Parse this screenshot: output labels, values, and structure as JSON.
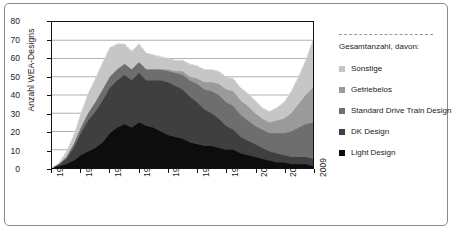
{
  "chart_data": {
    "type": "area",
    "title": "",
    "xlabel": "",
    "ylabel": "Anzahl WEA-Designs",
    "ylim": [
      0,
      80
    ],
    "ytick_values": [
      0,
      10,
      20,
      30,
      40,
      50,
      60,
      70,
      80
    ],
    "xlim": [
      1973,
      2009
    ],
    "xtick_labels": [
      "1973",
      "1977",
      "1981",
      "1985",
      "1989",
      "1993",
      "1997",
      "2001",
      "2005",
      "2009"
    ],
    "grid": "horizontal",
    "stacked": true,
    "legend_position": "right",
    "legend_title": "Gesamtanzahl, davon:",
    "x": [
      1973,
      1974,
      1975,
      1976,
      1977,
      1978,
      1979,
      1980,
      1981,
      1982,
      1983,
      1984,
      1985,
      1986,
      1987,
      1988,
      1989,
      1990,
      1991,
      1992,
      1993,
      1994,
      1995,
      1996,
      1997,
      1998,
      1999,
      2000,
      2001,
      2002,
      2003,
      2004,
      2005,
      2006,
      2007,
      2008,
      2009
    ],
    "series": [
      {
        "name": "Light Design",
        "color": "#0d0d0d",
        "values": [
          0,
          1,
          2,
          4,
          7,
          9,
          11,
          14,
          19,
          22,
          24,
          22,
          25,
          23,
          22,
          20,
          18,
          17,
          16,
          14,
          13,
          12,
          12,
          11,
          10,
          10,
          8,
          7,
          6,
          5,
          4,
          3,
          3,
          2,
          2,
          2,
          1
        ]
      },
      {
        "name": "DK Design",
        "color": "#3f3f3f",
        "values": [
          0,
          1,
          3,
          7,
          12,
          17,
          20,
          23,
          25,
          26,
          27,
          26,
          27,
          25,
          26,
          28,
          29,
          28,
          27,
          25,
          23,
          20,
          18,
          16,
          13,
          11,
          9,
          8,
          7,
          6,
          5,
          5,
          4,
          4,
          4,
          4,
          4
        ]
      },
      {
        "name": "Standard Drive Train Design",
        "color": "#6e6e6e",
        "values": [
          0,
          0,
          1,
          2,
          3,
          4,
          5,
          6,
          6,
          6,
          6,
          6,
          6,
          6,
          6,
          6,
          6,
          7,
          8,
          9,
          10,
          11,
          12,
          13,
          13,
          13,
          12,
          11,
          10,
          10,
          10,
          11,
          12,
          14,
          16,
          18,
          20
        ]
      },
      {
        "name": "Getriebelos",
        "color": "#9a9a9a",
        "values": [
          0,
          0,
          0,
          0,
          0,
          0,
          0,
          0,
          0,
          0,
          0,
          0,
          0,
          0,
          0,
          0,
          1,
          1,
          2,
          2,
          3,
          4,
          5,
          6,
          7,
          8,
          8,
          8,
          7,
          6,
          6,
          7,
          8,
          10,
          13,
          16,
          19
        ]
      },
      {
        "name": "Sonstige",
        "color": "#c6c6c6",
        "values": [
          0,
          1,
          3,
          5,
          8,
          11,
          13,
          15,
          16,
          14,
          11,
          10,
          10,
          9,
          8,
          7,
          6,
          6,
          6,
          7,
          7,
          7,
          7,
          7,
          7,
          7,
          7,
          7,
          7,
          6,
          6,
          7,
          9,
          12,
          15,
          19,
          26
        ]
      }
    ],
    "total_values": [
      0,
      3,
      9,
      18,
      30,
      41,
      49,
      58,
      66,
      68,
      68,
      64,
      68,
      63,
      62,
      61,
      60,
      59,
      59,
      57,
      56,
      54,
      54,
      53,
      50,
      49,
      44,
      41,
      37,
      33,
      31,
      33,
      36,
      42,
      50,
      59,
      70
    ]
  },
  "legend": {
    "title": "Gesamtanzahl, davon:",
    "items": [
      {
        "label": "Sonstige",
        "color": "#c6c6c6"
      },
      {
        "label": "Getriebelos",
        "color": "#9a9a9a"
      },
      {
        "label": "Standard Drive Train Design",
        "color": "#6e6e6e"
      },
      {
        "label": "DK Design",
        "color": "#3f3f3f"
      },
      {
        "label": "Light Design",
        "color": "#0d0d0d"
      }
    ]
  }
}
